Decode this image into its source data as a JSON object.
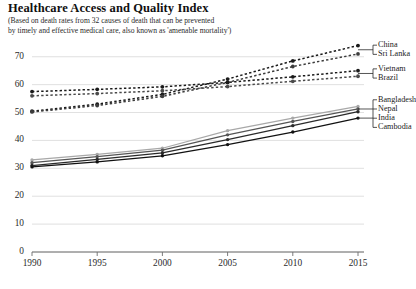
{
  "chart_data": {
    "type": "line",
    "title": "Healthcare Access and Quality Index",
    "subtitle_line1": "(Based on death rates from 32 causes of death that can be prevented",
    "subtitle_line2": "by timely and effective medical care, also known as 'amenable mortality')",
    "xlabel": "",
    "ylabel": "",
    "x": [
      1990,
      1995,
      2000,
      2005,
      2010,
      2015
    ],
    "xtick_labels": [
      "1990",
      "1995",
      "2000",
      "2005",
      "2010",
      "2015"
    ],
    "ytick_labels": [
      "0",
      "10",
      "20",
      "30",
      "40",
      "50",
      "60",
      "70"
    ],
    "yticks": [
      0,
      10,
      20,
      30,
      40,
      50,
      60,
      70
    ],
    "ylim": [
      0,
      76
    ],
    "xlim": [
      1990,
      2015
    ],
    "grid": "horizontal",
    "legend_position": "right-inline",
    "series": [
      {
        "name": "China",
        "values": [
          50.5,
          53.0,
          56.5,
          62.0,
          68.5,
          74.0
        ],
        "style": "dashed",
        "color": "#1a1a1a",
        "marker": "circle"
      },
      {
        "name": "Sri Lanka",
        "values": [
          50.2,
          52.5,
          55.8,
          60.8,
          66.5,
          71.0
        ],
        "style": "dashed",
        "color": "#3c3c3c",
        "marker": "circle"
      },
      {
        "name": "Vietnam",
        "values": [
          57.5,
          58.3,
          59.2,
          60.8,
          62.8,
          65.0
        ],
        "style": "dashed",
        "color": "#1a1a1a",
        "marker": "circle"
      },
      {
        "name": "Brazil",
        "values": [
          56.0,
          56.8,
          57.8,
          59.3,
          61.2,
          63.0
        ],
        "style": "dashed",
        "color": "#4a4a4a",
        "marker": "circle"
      },
      {
        "name": "Bangladesh",
        "values": [
          33.0,
          35.0,
          37.2,
          43.5,
          48.0,
          52.2
        ],
        "style": "solid",
        "color": "#a8a8a8",
        "marker": "circle"
      },
      {
        "name": "Nepal",
        "values": [
          32.0,
          34.2,
          36.5,
          42.0,
          46.8,
          51.3
        ],
        "style": "solid",
        "color": "#555555",
        "marker": "circle"
      },
      {
        "name": "Cambodia",
        "values": [
          31.0,
          33.2,
          35.5,
          40.3,
          45.3,
          50.3
        ],
        "style": "solid",
        "color": "#2a2a2a",
        "marker": "circle"
      },
      {
        "name": "India",
        "values": [
          30.5,
          32.3,
          34.5,
          38.5,
          43.0,
          48.0
        ],
        "style": "solid",
        "color": "#111111",
        "marker": "circle"
      }
    ],
    "legend_groups": [
      {
        "bracket": true,
        "names": [
          "China",
          "Sri Lanka"
        ]
      },
      {
        "bracket": true,
        "names": [
          "Vietnam",
          "Brazil"
        ]
      },
      {
        "bracket": true,
        "names": [
          "Bangladesh",
          "Nepal",
          "Cambodia"
        ]
      },
      {
        "bracket": false,
        "names": [
          "India"
        ]
      }
    ],
    "axis_color": "#7a7a7a",
    "grid_color": "#d8d8d8",
    "background": "#ffffff"
  }
}
